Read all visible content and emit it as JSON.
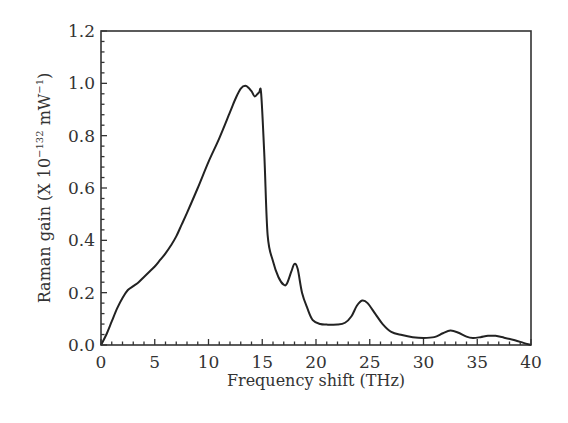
{
  "chart_data": {
    "type": "line",
    "title": "",
    "xlabel": "Frequency shift (THz)",
    "ylabel": {
      "prefix": "Raman gain (X 10",
      "exp1": "−132",
      "mid": " mW",
      "exp2": "−1",
      "suffix": ")"
    },
    "xlim": [
      0,
      40
    ],
    "ylim": [
      0.0,
      1.2
    ],
    "xticks": [
      0,
      5,
      10,
      15,
      20,
      25,
      30,
      35,
      40
    ],
    "xtick_labels": [
      "0",
      "5",
      "10",
      "15",
      "20",
      "25",
      "30",
      "35",
      "40"
    ],
    "yticks": [
      0.0,
      0.2,
      0.4,
      0.6,
      0.8,
      1.0,
      1.2
    ],
    "ytick_labels": [
      "0.0",
      "0.2",
      "0.4",
      "0.6",
      "0.8",
      "1.0",
      "1.2"
    ],
    "x_minor_step": 1,
    "y_minor_step": 0.04,
    "grid": false,
    "legend": null,
    "line_color": "#222222",
    "series": [
      {
        "name": "Raman gain",
        "x": [
          0,
          0.5,
          1.0,
          1.5,
          2.0,
          2.5,
          3.0,
          3.5,
          4.0,
          4.5,
          5.0,
          5.5,
          6.0,
          6.5,
          7.0,
          7.5,
          8.0,
          9.0,
          10.0,
          11.0,
          12.0,
          12.5,
          13.0,
          13.5,
          14.0,
          14.3,
          14.7,
          14.9,
          15.2,
          15.5,
          16.0,
          16.5,
          17.0,
          17.3,
          17.7,
          18.0,
          18.3,
          18.7,
          19.2,
          19.7,
          20.4,
          21.0,
          22.0,
          22.7,
          23.3,
          23.8,
          24.3,
          24.8,
          25.5,
          26.2,
          27.0,
          28.0,
          29.0,
          30.0,
          31.0,
          31.8,
          32.5,
          33.2,
          34.0,
          34.6,
          35.3,
          36.0,
          36.7,
          37.5,
          38.5,
          39.3,
          40.0
        ],
        "y": [
          0.0,
          0.04,
          0.09,
          0.14,
          0.18,
          0.21,
          0.225,
          0.24,
          0.26,
          0.28,
          0.3,
          0.325,
          0.35,
          0.38,
          0.415,
          0.46,
          0.505,
          0.6,
          0.7,
          0.79,
          0.89,
          0.94,
          0.98,
          0.99,
          0.97,
          0.95,
          0.965,
          0.96,
          0.72,
          0.42,
          0.32,
          0.26,
          0.23,
          0.235,
          0.28,
          0.31,
          0.29,
          0.2,
          0.14,
          0.095,
          0.08,
          0.078,
          0.078,
          0.085,
          0.11,
          0.15,
          0.17,
          0.16,
          0.12,
          0.08,
          0.05,
          0.038,
          0.03,
          0.027,
          0.03,
          0.045,
          0.055,
          0.048,
          0.032,
          0.027,
          0.03,
          0.035,
          0.035,
          0.028,
          0.018,
          0.008,
          0.0
        ]
      }
    ]
  }
}
